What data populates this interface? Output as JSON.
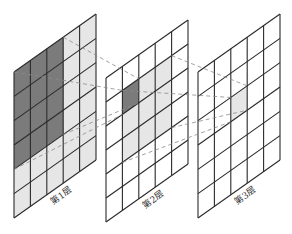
{
  "title": "",
  "colors": {
    "dark": "#7b7b7b",
    "light": "#e6e6e6",
    "white": "#ffffff",
    "line": "#2a2a2a",
    "dash": "#8a8a8a"
  },
  "layers": [
    {
      "id": "layer-1",
      "label": "第1层",
      "cols": 5,
      "rows": 6,
      "light_region": {
        "col_start": 0,
        "col_end": 4,
        "row_start": 0,
        "row_end": 5
      },
      "dark_region": {
        "col_start": 0,
        "col_end": 2,
        "row_start": 0,
        "row_end": 3
      }
    },
    {
      "id": "layer-2",
      "label": "第2层",
      "cols": 5,
      "rows": 6,
      "light_region": {
        "col_start": 1,
        "col_end": 3,
        "row_start": 1,
        "row_end": 3
      },
      "dark_region": {
        "col_start": 1,
        "col_end": 1,
        "row_start": 1,
        "row_end": 1
      }
    },
    {
      "id": "layer-3",
      "label": "第3层",
      "cols": 5,
      "rows": 6,
      "light_region": {
        "col_start": 2,
        "col_end": 2,
        "row_start": 2,
        "row_end": 2
      },
      "dark_region": null
    }
  ],
  "connections": [
    {
      "from_layer": 0,
      "from_region": "dark_region",
      "to_layer": 1,
      "to_region": "dark_region"
    },
    {
      "from_layer": 1,
      "from_region": "light_region",
      "to_layer": 2,
      "to_region": "light_region"
    }
  ]
}
